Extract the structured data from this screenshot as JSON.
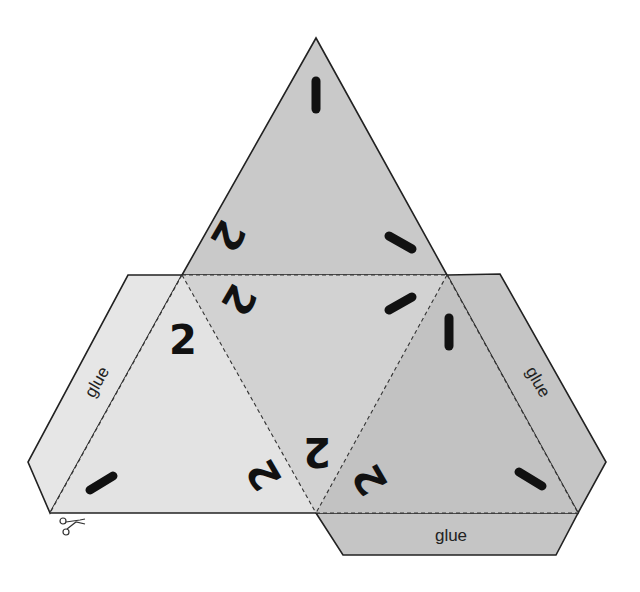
{
  "colors": {
    "top_face": "#c9c9c9",
    "center_face": "#d2d2d2",
    "left_face": "#e3e3e3",
    "right_face": "#c2c2c2",
    "left_tab": "#e6e6e6",
    "right_tab": "#c5c5c5",
    "bottom_tab": "#c5c5c5",
    "outline": "#222222"
  },
  "faces": {
    "top": {
      "marks": [
        "1",
        "1",
        "2"
      ]
    },
    "center": {
      "marks": [
        "2",
        "1",
        "2"
      ]
    },
    "left": {
      "marks": [
        "2",
        "1",
        "2"
      ]
    },
    "right": {
      "marks": [
        "1",
        "2",
        "1"
      ]
    }
  },
  "labels": {
    "top_top": "",
    "center_left": "2",
    "center_bottom": "2",
    "top_left": "2",
    "left_top": "2",
    "left_bottom_right": "2",
    "right_bottom_left": "2"
  },
  "tabs": {
    "left": "glue",
    "right": "glue",
    "bottom": "glue"
  },
  "cut_icon": "scissors-icon"
}
